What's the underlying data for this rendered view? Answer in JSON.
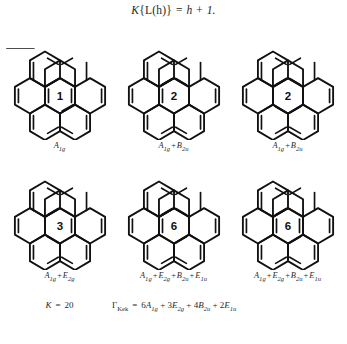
{
  "figure": {
    "top_equation": {
      "lhs_k": "K",
      "lhs_body": "{L(h)}",
      "equals": "=",
      "rhs": "h + 1."
    },
    "structures": [
      {
        "id": "structure-1",
        "count_label": "1",
        "symmetry": "A1g",
        "symmetry_terms": [
          {
            "letter": "A",
            "sub": "1g"
          }
        ],
        "kekule_pattern": "a"
      },
      {
        "id": "structure-2",
        "count_label": "2",
        "symmetry": "A1g + B2u",
        "symmetry_terms": [
          {
            "letter": "A",
            "sub": "1g"
          },
          {
            "letter": "B",
            "sub": "2u"
          }
        ],
        "kekule_pattern": "b"
      },
      {
        "id": "structure-3",
        "count_label": "2",
        "symmetry": "A1g + B2u",
        "symmetry_terms": [
          {
            "letter": "A",
            "sub": "1g"
          },
          {
            "letter": "B",
            "sub": "2u"
          }
        ],
        "kekule_pattern": "c"
      },
      {
        "id": "structure-4",
        "count_label": "3",
        "symmetry": "A1g + E2g",
        "symmetry_terms": [
          {
            "letter": "A",
            "sub": "1g"
          },
          {
            "letter": "E",
            "sub": "2g"
          }
        ],
        "kekule_pattern": "d"
      },
      {
        "id": "structure-5",
        "count_label": "6",
        "symmetry": "A1g + E2g + B2u + E1u",
        "symmetry_terms": [
          {
            "letter": "A",
            "sub": "1g"
          },
          {
            "letter": "E",
            "sub": "2g"
          },
          {
            "letter": "B",
            "sub": "2u"
          },
          {
            "letter": "E",
            "sub": "1u"
          }
        ],
        "kekule_pattern": "e"
      },
      {
        "id": "structure-6",
        "count_label": "6",
        "symmetry": "A1g + E2g + B2u + E1u",
        "symmetry_terms": [
          {
            "letter": "A",
            "sub": "1g"
          },
          {
            "letter": "E",
            "sub": "2g"
          },
          {
            "letter": "B",
            "sub": "2u"
          },
          {
            "letter": "E",
            "sub": "1u"
          }
        ],
        "kekule_pattern": "f"
      }
    ],
    "k_total": {
      "symbol": "K",
      "equals": "=",
      "value": "20"
    },
    "gamma_kek": {
      "symbol": "Γ",
      "sub": "Kek",
      "equals": "=",
      "terms": [
        {
          "coef": "6",
          "letter": "A",
          "sub": "1g"
        },
        {
          "coef": "3",
          "letter": "E",
          "sub": "2g"
        },
        {
          "coef": "4",
          "letter": "B",
          "sub": "2u"
        },
        {
          "coef": "2",
          "letter": "E",
          "sub": "1u"
        }
      ]
    },
    "caption_fragment": ""
  }
}
